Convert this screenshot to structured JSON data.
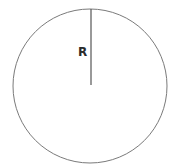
{
  "diagram": {
    "type": "circle-with-radius",
    "circle": {
      "cx": 90,
      "cy": 86,
      "r": 77,
      "stroke": "#7a7a7a",
      "fill": "#ffffff"
    },
    "radius_line": {
      "x1": 91,
      "y1": 9,
      "x2": 91,
      "y2": 85,
      "stroke": "#555555"
    },
    "label": {
      "text": "R",
      "x": 78,
      "y": 56,
      "color": "#2b2b2b"
    }
  }
}
